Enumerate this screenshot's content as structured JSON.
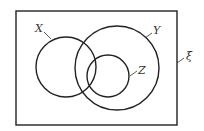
{
  "diagram": {
    "type": "venn",
    "universal_set_label": "ξ",
    "sets": [
      {
        "label": "X"
      },
      {
        "label": "Y"
      },
      {
        "label": "Z"
      }
    ]
  },
  "colors": {
    "stroke": "#222222",
    "background": "#ffffff"
  }
}
